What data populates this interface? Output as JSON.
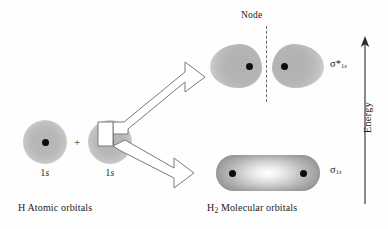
{
  "diagram": {
    "title_left": "H Atomic orbitals",
    "title_right_prefix": "H",
    "title_right_sub": "2",
    "title_right_suffix": " Molecular orbitals",
    "node_label": "Node",
    "energy_label": "Energy",
    "plus_sign": "+",
    "atomic_orbitals": [
      {
        "label_n": "1",
        "label_l": "s"
      },
      {
        "label_n": "1",
        "label_l": "s"
      }
    ],
    "molecular_orbitals": [
      {
        "name": "antibonding",
        "symbol": "σ",
        "star": "*",
        "sub_n": "1",
        "sub_l": "s"
      },
      {
        "name": "bonding",
        "symbol": "σ",
        "star": "",
        "sub_n": "1",
        "sub_l": "s"
      }
    ]
  },
  "colors": {
    "background": "#fefefe",
    "orbital_gray": "#bcbcbc",
    "nucleus": "#0d0d0d",
    "outline": "#7a7a7a",
    "text": "#1a1a1a",
    "node_dash": "#6d6d6d"
  }
}
